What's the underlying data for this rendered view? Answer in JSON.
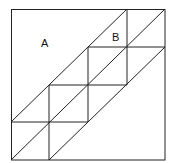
{
  "diagram": {
    "labels": [
      {
        "id": "A",
        "text": "A"
      },
      {
        "id": "B",
        "text": "B"
      }
    ],
    "stroke_color": "#222222",
    "background_color": "#ffffff",
    "grid_step": 38.5,
    "outer_square": {
      "x1": 11,
      "y1": 9,
      "x2": 165,
      "y2": 160
    }
  }
}
